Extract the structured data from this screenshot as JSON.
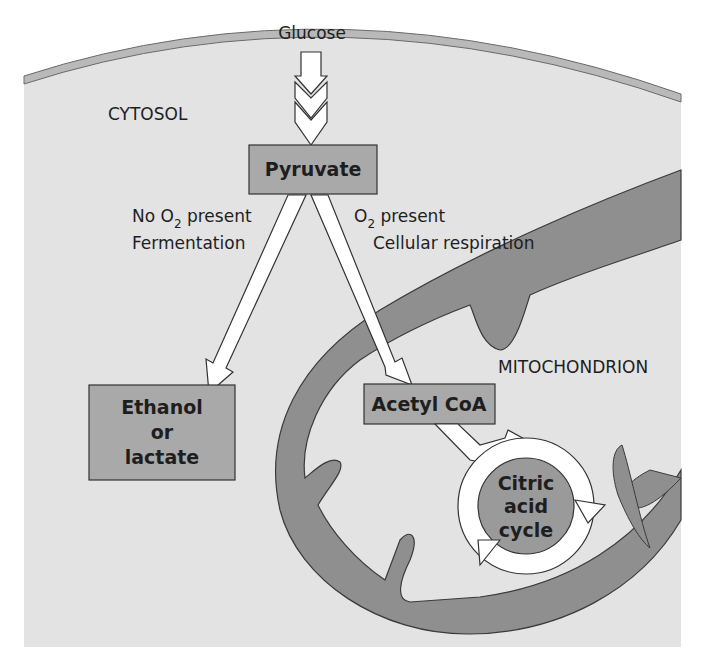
{
  "labels": {
    "glucose": "Glucose",
    "cytosol": "CYTOSOL",
    "mitochondrion": "MITOCHONDRION",
    "no_o2_prefix": "No O",
    "no_o2_sub": "2",
    "no_o2_suffix": " present",
    "fermentation": "Fermentation",
    "o2_prefix": "O",
    "o2_sub": "2",
    "o2_suffix": " present",
    "cellular_respiration": "Cellular respiration"
  },
  "boxes": {
    "pyruvate": "Pyruvate",
    "ethanol_line1": "Ethanol",
    "ethanol_line2": "or",
    "ethanol_line3": "lactate",
    "acetyl_coa": "Acetyl CoA",
    "citric_line1": "Citric",
    "citric_line2": "acid",
    "citric_line3": "cycle"
  },
  "colors": {
    "background": "#ffffff",
    "cytosol_fill": "#e3e3e3",
    "membrane": "#b4b4b4",
    "box_fill": "#a9a9a9",
    "mito_membrane_fill": "#8f8f8f",
    "mito_matrix": "#d9d9d9",
    "arrow_fill": "#ffffff",
    "stroke": "#333333"
  }
}
